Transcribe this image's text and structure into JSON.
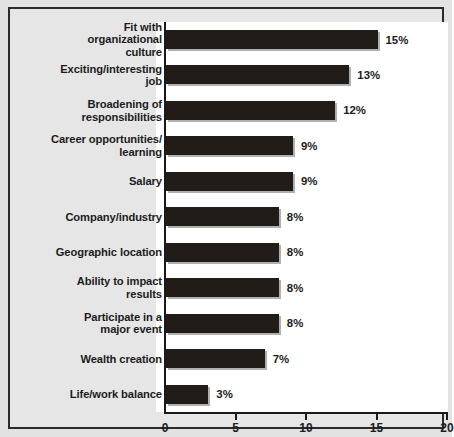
{
  "chart_data": {
    "type": "bar",
    "orientation": "horizontal",
    "title": "",
    "subtitle": "",
    "xlabel": "",
    "ylabel": "",
    "xlim": [
      0,
      20
    ],
    "xticks": [
      0,
      5,
      10,
      15,
      20
    ],
    "grid": false,
    "legend": null,
    "value_suffix": "%",
    "bar_color": "#211c18",
    "categories": [
      "Fit with\norganizational\nculture",
      "Exciting/interesting\njob",
      "Broadening of\nresponsibilities",
      "Career opportunities/\nlearning",
      "Salary",
      "Company/industry",
      "Geographic location",
      "Ability to impact\nresults",
      "Participate in a\nmajor event",
      "Wealth creation",
      "Life/work balance"
    ],
    "values": [
      15,
      13,
      12,
      9,
      9,
      8,
      8,
      8,
      8,
      7,
      3
    ],
    "data_labels": [
      "15%",
      "13%",
      "12%",
      "9%",
      "9%",
      "8%",
      "8%",
      "8%",
      "8%",
      "7%",
      "3%"
    ],
    "xtick_labels": [
      "0",
      "5",
      "10",
      "15",
      "20"
    ]
  }
}
